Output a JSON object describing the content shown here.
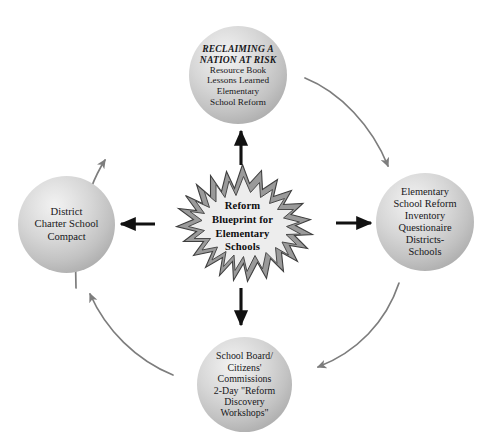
{
  "diagram": {
    "title": "Reform Blueprint for Elementary Schools",
    "colors": {
      "background": "#ffffff",
      "node_fill_light": "#f2f2f2",
      "node_fill_dark": "#9d9d9d",
      "straight_arrow": "#111111",
      "curved_arrow": "#7d7d7d",
      "burst_outline": "#4a4a4a",
      "burst_fill": "#ededed",
      "text": "#17171a"
    },
    "center": {
      "shape": "starburst",
      "lines": [
        "Reform",
        "Blueprint for",
        "Elementary",
        "Schools"
      ]
    },
    "nodes": [
      {
        "id": "top",
        "position": "top",
        "heading_lines": [
          "RECLAIMING A",
          "NATION AT RISK"
        ],
        "heading_style": "italic-bold",
        "lines": [
          "Resource Book",
          "Lessons Learned",
          "Elementary",
          "School Reform"
        ]
      },
      {
        "id": "right",
        "position": "right",
        "heading_lines": [],
        "lines": [
          "Elementary",
          "School Reform",
          "Inventory",
          "Questionaire",
          "Districts-",
          "Schools"
        ]
      },
      {
        "id": "bottom",
        "position": "bottom",
        "heading_lines": [],
        "lines": [
          "School Board/",
          "Citizens'",
          "Commissions",
          "2-Day \"Reform",
          "Discovery",
          "Workshops\""
        ]
      },
      {
        "id": "left",
        "position": "left",
        "heading_lines": [],
        "lines": [
          "District",
          "Charter School",
          "Compact"
        ]
      }
    ],
    "straight_arrows": [
      {
        "id": "center-to-top",
        "from": "center",
        "to": "top",
        "direction": "up"
      },
      {
        "id": "center-to-right",
        "from": "center",
        "to": "right",
        "direction": "right"
      },
      {
        "id": "center-to-bottom",
        "from": "center",
        "to": "bottom",
        "direction": "down"
      },
      {
        "id": "center-to-left",
        "from": "center",
        "to": "left",
        "direction": "left"
      }
    ],
    "curved_arrows": [
      {
        "id": "left-to-top",
        "from": "left",
        "to": "top",
        "sweep": "clockwise"
      },
      {
        "id": "top-to-right",
        "from": "top",
        "to": "right",
        "sweep": "clockwise"
      },
      {
        "id": "right-to-bottom",
        "from": "right",
        "to": "bottom",
        "sweep": "clockwise"
      },
      {
        "id": "bottom-to-left",
        "from": "bottom",
        "to": "left",
        "sweep": "clockwise"
      }
    ]
  }
}
